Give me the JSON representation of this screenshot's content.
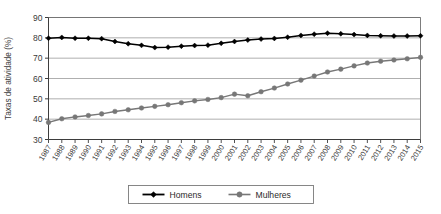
{
  "chart_data": {
    "type": "line",
    "title": "",
    "subtitle": "",
    "xlabel": "",
    "ylabel": "Taxas de atividade (%)",
    "xlim": [
      1987,
      2015
    ],
    "ylim": [
      30,
      90
    ],
    "ytick_step": 10,
    "yticks": [
      30,
      40,
      50,
      60,
      70,
      80,
      90
    ],
    "grid": true,
    "grid_axis": "y",
    "legend_position": "bottom-center",
    "categories": [
      "1987",
      "1988",
      "1989",
      "1990",
      "1991",
      "1992",
      "1993",
      "1994",
      "1995",
      "1996",
      "1997",
      "1998",
      "1999",
      "2000",
      "2001",
      "2002",
      "2003",
      "2004",
      "2005",
      "2006",
      "2007",
      "2008",
      "2009",
      "2010",
      "2011",
      "2012",
      "2013",
      "2014",
      "2015"
    ],
    "series": [
      {
        "name": "Homens",
        "color": "#000000",
        "marker": "diamond",
        "values": [
          79.8,
          80.2,
          79.8,
          79.8,
          79.6,
          78.2,
          77.1,
          76.3,
          75.2,
          75.4,
          75.9,
          76.2,
          76.4,
          77.3,
          78.2,
          78.9,
          79.4,
          79.7,
          80.3,
          81.2,
          81.8,
          82.3,
          82.0,
          81.6,
          81.2,
          81.0,
          80.9,
          80.9,
          81.0
        ]
      },
      {
        "name": "Mulheres",
        "color": "#777777",
        "marker": "circle",
        "values": [
          38.4,
          40.2,
          41.1,
          41.8,
          42.6,
          43.8,
          44.6,
          45.5,
          46.3,
          47.1,
          48.1,
          49.0,
          49.7,
          50.6,
          52.3,
          51.5,
          53.5,
          55.3,
          57.3,
          59.2,
          61.2,
          63.2,
          64.6,
          66.2,
          67.6,
          68.5,
          69.1,
          69.7,
          70.4
        ]
      }
    ],
    "legend": [
      {
        "label": "Homens",
        "color": "#000000",
        "marker": "diamond"
      },
      {
        "label": "Mulheres",
        "color": "#777777",
        "marker": "circle"
      }
    ]
  }
}
